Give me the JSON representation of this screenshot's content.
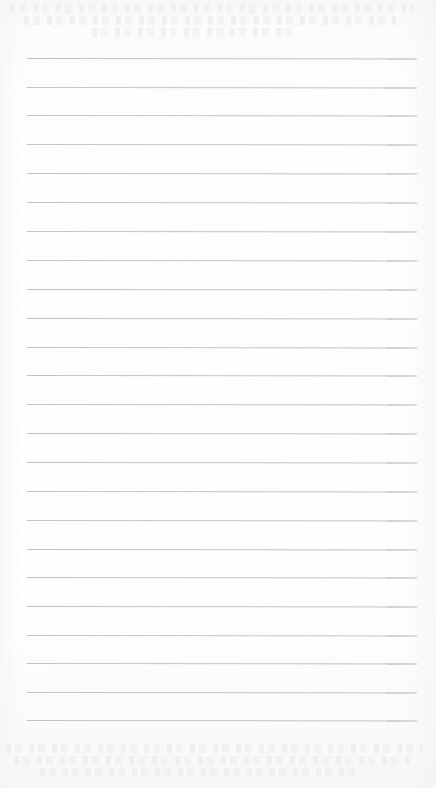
{
  "document": {
    "kind": "scanned-lined-notepad-page",
    "title": "Blank lined paper",
    "page_width": 436,
    "page_height": 788,
    "has_visible_text": false,
    "text_content": ""
  },
  "paper": {
    "background_color": "#fdfdfd",
    "edge_tint_color": "#f6f6f7",
    "left_margin_px": 27,
    "right_margin_px": 19
  },
  "ruling": {
    "line_color": "#c2c2c4",
    "line_thickness_px": 1,
    "line_spacing_px": 29,
    "first_line_y_px": 58,
    "line_left_x_px": 27,
    "line_right_x_px": 417,
    "line_count": 24,
    "line_y_positions": [
      58,
      87,
      115,
      144,
      173,
      202,
      231,
      260,
      289,
      318,
      347,
      375,
      404,
      433,
      462,
      491,
      520,
      549,
      577,
      606,
      635,
      663,
      692,
      720
    ]
  },
  "show_through": {
    "description": "faint illegible ghost text bleeding through from reverse side",
    "color": "#e4e5e8",
    "top_band": {
      "y": 0,
      "height": 46,
      "rows": [
        {
          "top": 4,
          "left": 10,
          "width": 404
        },
        {
          "top": 16,
          "left": 24,
          "width": 372
        },
        {
          "top": 28,
          "left": 92,
          "width": 206
        }
      ]
    },
    "bottom_band": {
      "y": 736,
      "height": 52,
      "rows": [
        {
          "top": 8,
          "left": 6,
          "width": 416
        },
        {
          "top": 20,
          "left": 14,
          "width": 398
        },
        {
          "top": 32,
          "left": 40,
          "width": 318
        }
      ]
    }
  }
}
